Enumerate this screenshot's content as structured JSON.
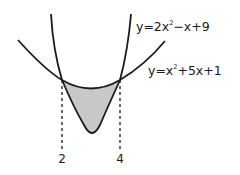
{
  "diagram": {
    "type": "area-between-curves",
    "curves": [
      {
        "name": "steep-parabola",
        "equation_prefix": "y=2x",
        "exponent": "2",
        "equation_suffix": "−x+9"
      },
      {
        "name": "wide-parabola",
        "equation_prefix": "y=x",
        "exponent": "2",
        "equation_suffix": "+5x+1"
      }
    ],
    "x_markers": [
      {
        "label": "2"
      },
      {
        "label": "4"
      }
    ],
    "shaded_region": {
      "fill": "#c8c8c8",
      "bounded_between_x": [
        "2",
        "4"
      ]
    },
    "colors": {
      "stroke": "#1a1a1a",
      "shade": "#c8c8c8"
    }
  }
}
